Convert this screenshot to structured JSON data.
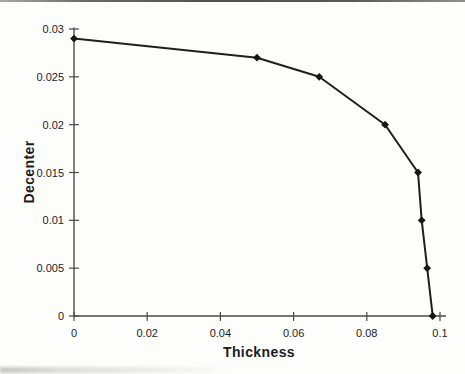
{
  "chart_data": {
    "type": "line",
    "title": "",
    "xlabel": "Thickness",
    "ylabel": "Decenter",
    "series": [
      {
        "name": "decenter-vs-thickness",
        "x": [
          0,
          0.05,
          0.067,
          0.085,
          0.094,
          0.095,
          0.0965,
          0.098
        ],
        "y": [
          0.029,
          0.027,
          0.025,
          0.02,
          0.015,
          0.01,
          0.005,
          0
        ]
      }
    ],
    "xlim": [
      0,
      0.1
    ],
    "ylim": [
      0,
      0.03
    ],
    "x_ticks": [
      {
        "v": 0,
        "label": "0"
      },
      {
        "v": 0.02,
        "label": "0.02"
      },
      {
        "v": 0.04,
        "label": "0.04"
      },
      {
        "v": 0.06,
        "label": "0.06"
      },
      {
        "v": 0.08,
        "label": "0.08"
      },
      {
        "v": 0.1,
        "label": "0.1"
      }
    ],
    "y_ticks": [
      {
        "v": 0,
        "label": "0"
      },
      {
        "v": 0.005,
        "label": "0.005"
      },
      {
        "v": 0.01,
        "label": "0.01"
      },
      {
        "v": 0.015,
        "label": "0.015"
      },
      {
        "v": 0.02,
        "label": "0.02"
      },
      {
        "v": 0.025,
        "label": "0.025"
      },
      {
        "v": 0.03,
        "label": "0.03"
      }
    ],
    "grid": false,
    "legend": false,
    "marker": "diamond",
    "line_color": "#1f1f1f",
    "marker_color": "#161616",
    "axis_color": "#4a4a4a",
    "text_color": "#1c1c1c"
  }
}
